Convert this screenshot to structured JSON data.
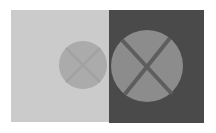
{
  "figure": {
    "type": "simultaneous-contrast-illusion",
    "canvas": {
      "width": 216,
      "height": 133,
      "background": "#ffffff"
    },
    "panels": [
      {
        "name": "light-panel",
        "x": 11,
        "y": 10,
        "width": 98,
        "height": 112,
        "fill": "#cbcbcb",
        "circle": {
          "cx": 83,
          "cy": 65,
          "r": 24,
          "fill": "#ababab",
          "cross": {
            "stroke": "#a2a2a2",
            "stroke_width": 2.5,
            "line1": [
              66,
              48,
              100,
              82
            ],
            "line2": [
              100,
              48,
              66,
              82
            ]
          }
        }
      },
      {
        "name": "dark-panel",
        "x": 109,
        "y": 10,
        "width": 95,
        "height": 113,
        "fill": "#4a4a4a",
        "circle": {
          "cx": 147,
          "cy": 66,
          "r": 36,
          "fill": "#8c8c8c",
          "cross": {
            "stroke": "#5e5e5e",
            "stroke_width": 4,
            "line1": [
              122,
              40,
              172,
              94
            ],
            "line2": [
              170,
              38,
              125,
              94
            ]
          }
        }
      }
    ]
  }
}
